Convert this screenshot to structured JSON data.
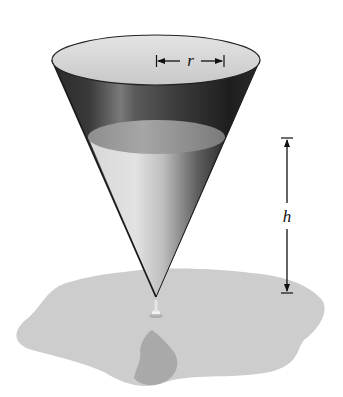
{
  "figure": {
    "labels": {
      "radius": "r",
      "height": "h"
    },
    "colors": {
      "background": "#ffffff",
      "cone_dark": "#1e1e1e",
      "cone_highlight": "#8a8a8a",
      "rim_interior": "#d6d6d6",
      "water_surface": "#9e9e9e",
      "water_body": "#cfcfcf",
      "puddle": "#cdcdcd",
      "puddle_shadow": "#a9a9a9",
      "line": "#111111"
    }
  }
}
